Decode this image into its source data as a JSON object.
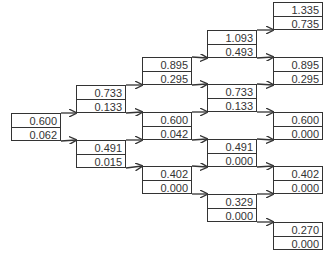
{
  "tree": {
    "columns": 5,
    "nodes": [
      {
        "id": "n0_0",
        "col": 0,
        "x": 11,
        "y": 113,
        "value": "0.600",
        "option": "0.062"
      },
      {
        "id": "n1_0",
        "col": 1,
        "x": 76,
        "y": 85,
        "value": "0.733",
        "option": "0.133"
      },
      {
        "id": "n1_1",
        "col": 1,
        "x": 76,
        "y": 140,
        "value": "0.491",
        "option": "0.015"
      },
      {
        "id": "n2_0",
        "col": 2,
        "x": 142,
        "y": 57,
        "value": "0.895",
        "option": "0.295"
      },
      {
        "id": "n2_1",
        "col": 2,
        "x": 142,
        "y": 112,
        "value": "0.600",
        "option": "0.042"
      },
      {
        "id": "n2_2",
        "col": 2,
        "x": 142,
        "y": 166,
        "value": "0.402",
        "option": "0.000"
      },
      {
        "id": "n3_0",
        "col": 3,
        "x": 207,
        "y": 30,
        "value": "1.093",
        "option": "0.493"
      },
      {
        "id": "n3_1",
        "col": 3,
        "x": 207,
        "y": 84,
        "value": "0.733",
        "option": "0.133"
      },
      {
        "id": "n3_2",
        "col": 3,
        "x": 207,
        "y": 139,
        "value": "0.491",
        "option": "0.000"
      },
      {
        "id": "n3_3",
        "col": 3,
        "x": 207,
        "y": 194,
        "value": "0.329",
        "option": "0.000"
      },
      {
        "id": "n4_0",
        "col": 4,
        "x": 273,
        "y": 2,
        "value": "1.335",
        "option": "0.735"
      },
      {
        "id": "n4_1",
        "col": 4,
        "x": 273,
        "y": 57,
        "value": "0.895",
        "option": "0.295"
      },
      {
        "id": "n4_2",
        "col": 4,
        "x": 273,
        "y": 112,
        "value": "0.600",
        "option": "0.000"
      },
      {
        "id": "n4_3",
        "col": 4,
        "x": 273,
        "y": 166,
        "value": "0.402",
        "option": "0.000"
      },
      {
        "id": "n4_4",
        "col": 4,
        "x": 273,
        "y": 222,
        "value": "0.270",
        "option": "0.000"
      }
    ],
    "edges": [
      [
        "n0_0",
        "n1_0"
      ],
      [
        "n0_0",
        "n1_1"
      ],
      [
        "n1_0",
        "n2_0"
      ],
      [
        "n1_0",
        "n2_1"
      ],
      [
        "n1_1",
        "n2_1"
      ],
      [
        "n1_1",
        "n2_2"
      ],
      [
        "n2_0",
        "n3_0"
      ],
      [
        "n2_0",
        "n3_1"
      ],
      [
        "n2_1",
        "n3_1"
      ],
      [
        "n2_1",
        "n3_2"
      ],
      [
        "n2_2",
        "n3_2"
      ],
      [
        "n2_2",
        "n3_3"
      ],
      [
        "n3_0",
        "n4_0"
      ],
      [
        "n3_0",
        "n4_1"
      ],
      [
        "n3_1",
        "n4_1"
      ],
      [
        "n3_1",
        "n4_2"
      ],
      [
        "n3_2",
        "n4_2"
      ],
      [
        "n3_2",
        "n4_3"
      ],
      [
        "n3_3",
        "n4_3"
      ],
      [
        "n3_3",
        "n4_4"
      ]
    ],
    "colors": {
      "line": "#333333",
      "box_border": "#333333",
      "text": "#333333",
      "background": "#ffffff"
    }
  }
}
